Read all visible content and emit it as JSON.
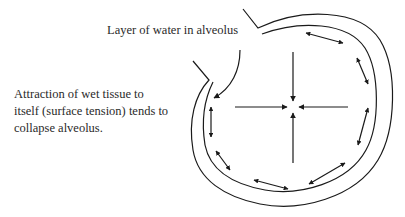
{
  "diagram": {
    "labels": {
      "water_layer": "Layer of water in alveolus",
      "attraction": {
        "line1": "Attraction of wet tissue to",
        "line2": "itself (surface tension) tends to",
        "line3": "collapse alveolus."
      }
    },
    "stroke_color": "#1a1a1a",
    "text_color": "#2a2a2a",
    "elements": {
      "outer_wall": "alveolus-outer-wall",
      "inner_wall": "alveolus-inner-wall",
      "center_arrows": [
        "down",
        "up",
        "right",
        "left"
      ],
      "wall_double_arrows": 8,
      "pointer_arrow": "points from label to water layer"
    }
  }
}
